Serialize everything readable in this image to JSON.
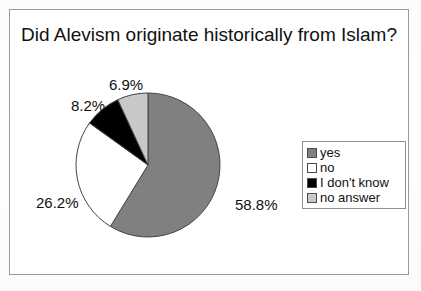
{
  "chart_data": {
    "type": "pie",
    "title": "Did Alevism originate historically from Islam?",
    "categories": [
      "yes",
      "no",
      "I don't know",
      "no answer"
    ],
    "values": [
      58.8,
      26.2,
      8.2,
      6.9
    ],
    "value_labels": [
      "58.8%",
      "26.2%",
      "8.2%",
      "6.9%"
    ],
    "unit": "%",
    "colors": [
      "#808080",
      "#ffffff",
      "#000000",
      "#c8c8c8"
    ],
    "slice_border_color": "#444444",
    "start_angle_deg": 0,
    "direction": "clockwise",
    "legend_position": "right",
    "grid": false,
    "xlabel": "",
    "ylabel": ""
  },
  "frame": {
    "border_color": "#9a9a9a"
  },
  "legend": {
    "items": [
      {
        "label": "yes",
        "color": "#808080"
      },
      {
        "label": "no",
        "color": "#ffffff"
      },
      {
        "label": "I don't know",
        "color": "#000000"
      },
      {
        "label": "no answer",
        "color": "#c8c8c8"
      }
    ]
  }
}
